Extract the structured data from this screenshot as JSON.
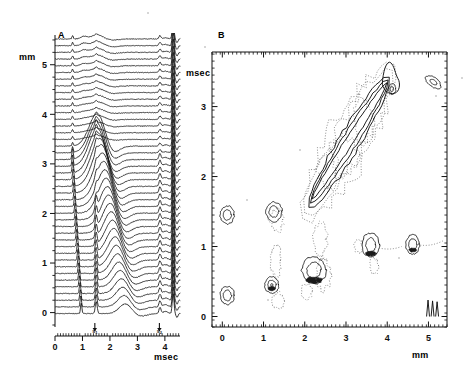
{
  "figure": {
    "background": "#ffffff",
    "ink": "#111111",
    "dotted_ink": "#6f6f6f",
    "width": 472,
    "height": 366
  },
  "panels": [
    {
      "id": "A",
      "label": "A",
      "label_pos": {
        "x": 58,
        "y": 30
      },
      "type": "waterfall",
      "description": "Stacked waveform traces (waterfall plot) of signal versus time at successive spatial positions",
      "plot_box": {
        "x": 55,
        "y": 35,
        "w": 125,
        "h": 290
      },
      "x_axis": {
        "label": "msec",
        "label_pos": {
          "x": 154,
          "y": 352
        },
        "min": 0,
        "max": 4.55,
        "ticks": [
          0,
          1,
          2,
          3,
          4
        ],
        "tick_labels": [
          "0",
          "1",
          "2",
          "3",
          "4"
        ],
        "minor_tick_step": 0.1
      },
      "y_axis": {
        "label": "mm",
        "label_pos": {
          "x": 19,
          "y": 52
        },
        "min": -0.25,
        "max": 5.6,
        "ticks": [
          0,
          1,
          2,
          3,
          4,
          5
        ],
        "tick_labels": [
          "0",
          "1",
          "2",
          "3",
          "4",
          "5"
        ],
        "minor_tick_step": 0.25
      },
      "markers": [
        {
          "name": "s1",
          "label": "s",
          "sub": "1",
          "time": 1.45
        },
        {
          "name": "s2",
          "label": "s",
          "sub": "2",
          "time": 3.8
        }
      ],
      "trace_count": 42
    },
    {
      "id": "B",
      "label": "B",
      "label_pos": {
        "x": 218,
        "y": 30
      },
      "type": "contour",
      "description": "Contour map of the same data in distance (mm) versus time (msec); solid contours positive, dotted contours negative",
      "plot_box": {
        "x": 212,
        "y": 52,
        "w": 235,
        "h": 275
      },
      "x_axis": {
        "label": "mm",
        "label_pos": {
          "x": 412,
          "y": 350
        },
        "min": -0.25,
        "max": 5.45,
        "ticks": [
          0,
          1,
          2,
          3,
          4,
          5
        ],
        "tick_labels": [
          "0",
          "1",
          "2",
          "3",
          "4",
          "5"
        ],
        "minor_tick_step": 0.1
      },
      "y_axis": {
        "label": "msec",
        "label_pos": {
          "x": 186,
          "y": 68
        },
        "min": -0.15,
        "max": 3.78,
        "ticks": [
          0,
          1,
          2,
          3
        ],
        "tick_labels": [
          "0",
          "1",
          "2",
          "3"
        ],
        "minor_tick_step": 0.1
      }
    }
  ],
  "chart_data": [
    {
      "type": "line",
      "panel": "A",
      "title": "",
      "xlabel": "msec",
      "ylabel": "mm",
      "xlim": [
        0,
        4.55
      ],
      "ylim": [
        -0.25,
        5.6
      ],
      "grid": false,
      "legend": "none",
      "series_note": "42 stacked traces, one per spatial position from 0 to 5.5 mm; each trace is signal amplitude versus time",
      "annotations": [
        {
          "text": "s1",
          "x": 1.45,
          "y": -0.18
        },
        {
          "text": "s2",
          "x": 3.8,
          "y": -0.18
        }
      ]
    },
    {
      "type": "contour",
      "panel": "B",
      "title": "",
      "xlabel": "mm",
      "ylabel": "msec",
      "xlim": [
        -0.25,
        5.45
      ],
      "ylim": [
        -0.15,
        3.78
      ],
      "grid": false,
      "legend": "none",
      "contour_styles": {
        "positive": "solid",
        "negative": "dotted"
      },
      "features": [
        {
          "name": "diagonal-ridge",
          "style": "solid",
          "x_range": [
            2.05,
            4.1
          ],
          "y_range": [
            1.55,
            3.65
          ],
          "levels": 3
        },
        {
          "name": "diagonal-ridge-halo",
          "style": "dotted",
          "x_range": [
            1.85,
            4.35
          ],
          "y_range": [
            1.45,
            3.6
          ]
        },
        {
          "name": "blob-left-upper",
          "style": "solid",
          "x": 0.12,
          "y": 1.45
        },
        {
          "name": "blob-left-lower",
          "style": "solid",
          "x": 0.12,
          "y": 0.3
        },
        {
          "name": "blob-x1-upper",
          "style": "solid",
          "x": 1.25,
          "y": 1.5
        },
        {
          "name": "blob-x1-lower",
          "style": "solid",
          "x": 1.2,
          "y": 0.45
        },
        {
          "name": "blob-x1-halo",
          "style": "dotted",
          "x": 1.28,
          "y": 0.78
        },
        {
          "name": "blob-x2-main",
          "style": "solid",
          "x": 2.2,
          "y": 0.62
        },
        {
          "name": "blob-x2-halo",
          "style": "dotted",
          "x": 2.3,
          "y": 1.05
        },
        {
          "name": "blob-x3p6",
          "style": "solid",
          "x": 3.6,
          "y": 1.0
        },
        {
          "name": "blob-x4p6",
          "style": "solid",
          "x": 4.6,
          "y": 1.05
        },
        {
          "name": "blob-far-right",
          "style": "solid",
          "x": 5.12,
          "y": 3.35
        },
        {
          "name": "edge-spikes",
          "style": "solid",
          "x_range": [
            4.95,
            5.3
          ],
          "y_range": [
            0.0,
            0.25
          ],
          "count": 3
        }
      ]
    }
  ]
}
